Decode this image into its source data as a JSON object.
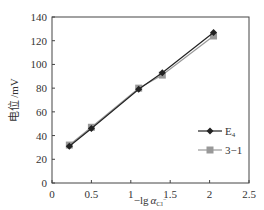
{
  "chart_data": {
    "type": "line",
    "title": "",
    "xlabel": "−lg α_Cl⁻",
    "ylabel": "电位 /mV",
    "xlim": [
      0,
      2.5
    ],
    "ylim": [
      0,
      140
    ],
    "x_ticks": [
      "0",
      "0.5",
      "1",
      "1.5",
      "2",
      "2.5"
    ],
    "y_ticks": [
      "0",
      "20",
      "40",
      "60",
      "80",
      "100",
      "120",
      "140"
    ],
    "grid": false,
    "legend_position": "lower right inside",
    "series": [
      {
        "name": "E4",
        "marker": "diamond",
        "color": "#222222",
        "x": [
          0.22,
          0.5,
          1.1,
          1.4,
          2.05
        ],
        "y": [
          31,
          46,
          79,
          93,
          127
        ]
      },
      {
        "name": "3-1",
        "marker": "square",
        "color": "#999999",
        "x": [
          0.22,
          0.5,
          1.1,
          1.4,
          2.05
        ],
        "y": [
          32,
          47,
          80,
          91,
          124
        ]
      }
    ]
  },
  "axes": {
    "ylabel_main": "电位",
    "ylabel_unit": "/mV",
    "xlabel_prefix": "−lg",
    "xlabel_var": "α",
    "xlabel_sub": "Cl",
    "xlabel_sup": "−"
  },
  "legend": {
    "items": [
      {
        "label_main": "E",
        "label_sub": "4"
      },
      {
        "label_main": "3−1",
        "label_sub": ""
      }
    ]
  }
}
